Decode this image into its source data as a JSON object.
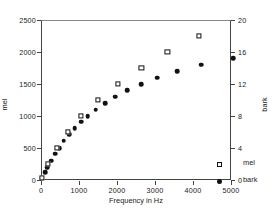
{
  "chart_data": {
    "type": "scatter",
    "title": "",
    "xlabel": "Frequency in Hz",
    "xlim": [
      0,
      5000
    ],
    "xticks": [
      0,
      1000,
      2000,
      3000,
      4000,
      5000
    ],
    "xticklabels": [
      "0",
      "1000",
      "2000",
      "3000",
      "4000",
      "5000"
    ],
    "grid": false,
    "legend_position": "lower-right-inside",
    "axes": [
      {
        "id": "left",
        "ylabel": "mel",
        "ylim": [
          0,
          2500
        ],
        "yticks": [
          0,
          500,
          1000,
          1500,
          2000,
          2500
        ],
        "yticklabels": [
          "0",
          "500",
          "1000",
          "1500",
          "2000",
          "2500"
        ]
      },
      {
        "id": "right",
        "ylabel": "bark",
        "ylim": [
          0,
          20
        ],
        "yticks": [
          0,
          4,
          8,
          12,
          16,
          20
        ],
        "yticklabels": [
          "0",
          "4",
          "8",
          "12",
          "16",
          "20"
        ]
      }
    ],
    "series": [
      {
        "name": "mel",
        "marker": "open-square",
        "axis": "left",
        "color": "#111111",
        "points": [
          {
            "x": 20,
            "y": 30
          },
          {
            "x": 160,
            "y": 250
          },
          {
            "x": 394,
            "y": 500
          },
          {
            "x": 670,
            "y": 750
          },
          {
            "x": 1000,
            "y": 1000
          },
          {
            "x": 1420,
            "y": 1250
          },
          {
            "x": 1930,
            "y": 1500
          },
          {
            "x": 2510,
            "y": 1750
          },
          {
            "x": 3160,
            "y": 2000
          },
          {
            "x": 3950,
            "y": 2250
          }
        ]
      },
      {
        "name": "bark",
        "marker": "filled-circle",
        "axis": "right",
        "color": "#111111",
        "points": [
          {
            "x": 20,
            "y": 0.2
          },
          {
            "x": 100,
            "y": 1.0
          },
          {
            "x": 160,
            "y": 1.6
          },
          {
            "x": 250,
            "y": 2.4
          },
          {
            "x": 350,
            "y": 3.3
          },
          {
            "x": 450,
            "y": 4.0
          },
          {
            "x": 570,
            "y": 4.9
          },
          {
            "x": 700,
            "y": 5.7
          },
          {
            "x": 840,
            "y": 6.5
          },
          {
            "x": 1000,
            "y": 7.3
          },
          {
            "x": 1170,
            "y": 8.0
          },
          {
            "x": 1370,
            "y": 8.8
          },
          {
            "x": 1600,
            "y": 9.6
          },
          {
            "x": 1850,
            "y": 10.4
          },
          {
            "x": 2150,
            "y": 11.2
          },
          {
            "x": 2500,
            "y": 12.0
          },
          {
            "x": 2900,
            "y": 12.8
          },
          {
            "x": 3400,
            "y": 13.6
          },
          {
            "x": 4000,
            "y": 14.4
          },
          {
            "x": 4800,
            "y": 15.2
          }
        ]
      }
    ],
    "plotted_markers": {
      "mel_px": [
        {
          "x": 0.8,
          "y": 1.2
        },
        {
          "x": 6.5,
          "y": 10.0
        },
        {
          "x": 15.8,
          "y": 20.0
        },
        {
          "x": 26.8,
          "y": 30.0
        },
        {
          "x": 40.0,
          "y": 40.0
        },
        {
          "x": 56.8,
          "y": 50.0
        },
        {
          "x": 77.2,
          "y": 60.0
        },
        {
          "x": 100.4,
          "y": 70.0
        },
        {
          "x": 126.4,
          "y": 80.0
        },
        {
          "x": 158.0,
          "y": 90.0
        }
      ],
      "bark_px": [
        {
          "x": 0.8,
          "y": 1.0
        },
        {
          "x": 4.0,
          "y": 5.0
        },
        {
          "x": 6.4,
          "y": 8.0
        },
        {
          "x": 10.0,
          "y": 12.0
        },
        {
          "x": 14.0,
          "y": 16.5
        },
        {
          "x": 18.0,
          "y": 20.0
        },
        {
          "x": 22.8,
          "y": 24.5
        },
        {
          "x": 28.0,
          "y": 28.5
        },
        {
          "x": 33.6,
          "y": 32.5
        },
        {
          "x": 40.0,
          "y": 36.5
        },
        {
          "x": 46.8,
          "y": 40.0
        },
        {
          "x": 54.8,
          "y": 44.0
        },
        {
          "x": 64.0,
          "y": 48.0
        },
        {
          "x": 74.0,
          "y": 52.0
        },
        {
          "x": 86.0,
          "y": 56.0
        },
        {
          "x": 100.0,
          "y": 60.0
        },
        {
          "x": 116.0,
          "y": 64.0
        },
        {
          "x": 136.0,
          "y": 68.0
        },
        {
          "x": 160.0,
          "y": 72.0
        },
        {
          "x": 192.0,
          "y": 76.0
        }
      ]
    }
  },
  "legend": {
    "entries": [
      {
        "label": "mel",
        "marker": "open-square"
      },
      {
        "label": "bark",
        "marker": "filled-circle"
      }
    ]
  }
}
